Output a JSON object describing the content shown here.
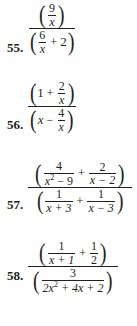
{
  "problems": [
    {
      "number": "55.",
      "numerator": {
        "frac": {
          "n": "9",
          "d": "x"
        }
      },
      "denominator": {
        "frac": {
          "n": "6",
          "d": "x"
        },
        "op": "+",
        "term": "2"
      }
    },
    {
      "number": "56.",
      "numerator": {
        "term": "1",
        "op": "+",
        "frac": {
          "n": "2",
          "d": "x"
        }
      },
      "denominator": {
        "term": "x",
        "op": "−",
        "frac": {
          "n": "4",
          "d": "x"
        }
      }
    },
    {
      "number": "57.",
      "numerator": {
        "frac1": {
          "n": "4",
          "d_base": "x",
          "d_exp": "2",
          "d_rest": " − 9"
        },
        "op": "+",
        "frac2": {
          "n": "2",
          "d": "x − 2"
        }
      },
      "denominator": {
        "frac1": {
          "n": "1",
          "d": "x + 3"
        },
        "op": "+",
        "frac2": {
          "n": "1",
          "d": "x − 3"
        }
      }
    },
    {
      "number": "58.",
      "numerator": {
        "frac1": {
          "n": "1",
          "d": "x + 1"
        },
        "op": "+",
        "frac2": {
          "n": "1",
          "d": "2"
        }
      },
      "denominator": {
        "frac": {
          "n": "3",
          "d_a": "2x",
          "d_exp": "2",
          "d_rest": " + 4x + 2"
        }
      }
    }
  ]
}
